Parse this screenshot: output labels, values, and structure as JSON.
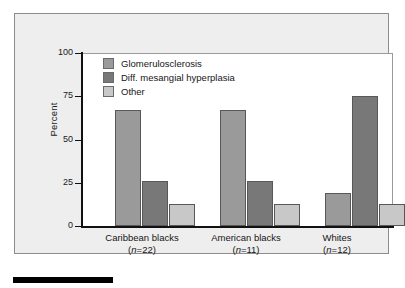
{
  "figure": {
    "panel_background": "#eeeeee",
    "plot_background": "#ffffff",
    "axis_color": "#111111"
  },
  "chart_data": {
    "type": "bar",
    "title": "",
    "xlabel": "",
    "ylabel": "Percent",
    "ylim": [
      0,
      100
    ],
    "yticks": [
      0,
      25,
      50,
      75,
      100
    ],
    "ytick_labels": [
      "0",
      "25",
      "50",
      "75",
      "100"
    ],
    "grid": false,
    "legend_position": "upper left",
    "categories": [
      "Caribbean blacks",
      "American blacks",
      "Whites"
    ],
    "category_counts": [
      "(n=22)",
      "(n=11)",
      "(n=12)"
    ],
    "category_n_prefix": "(",
    "category_n_letter": "n",
    "series": [
      {
        "name": "Glomerulosclerosis",
        "color": "#9a9a9a",
        "values": [
          67,
          67,
          19
        ]
      },
      {
        "name": "Diff. mesangial hyperplasia",
        "color": "#787878",
        "values": [
          26,
          26,
          75
        ]
      },
      {
        "name": "Other",
        "color": "#c8c8c8",
        "values": [
          12.5,
          12.5,
          12.5
        ]
      }
    ]
  },
  "legend": {
    "items": [
      {
        "label": "Glomerulosclerosis",
        "color": "#9a9a9a"
      },
      {
        "label": "Diff. mesangial hyperplasia",
        "color": "#787878"
      },
      {
        "label": "Other",
        "color": "#c8c8c8"
      }
    ]
  },
  "axes": {
    "y_title": "Percent",
    "y_labels": [
      "100",
      "75",
      "50",
      "25",
      "0"
    ]
  },
  "x_labels": [
    {
      "name": "Caribbean blacks",
      "count": "=22"
    },
    {
      "name": "American blacks",
      "count": "=11"
    },
    {
      "name": "Whites",
      "count": "=12"
    }
  ]
}
